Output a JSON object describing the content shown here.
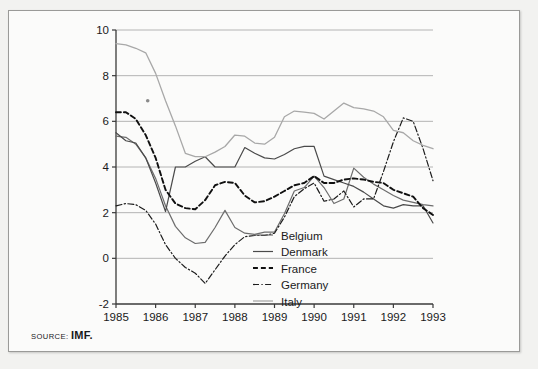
{
  "figure": {
    "source_keyword": "SOURCE:",
    "source_value": "IMF."
  },
  "chart_data": {
    "type": "line",
    "title": "",
    "subtitle": "",
    "xlabel": "",
    "ylabel": "",
    "xlim": [
      1985,
      1993
    ],
    "ylim": [
      -2,
      10
    ],
    "xticks": [
      1985,
      1986,
      1987,
      1988,
      1989,
      1990,
      1991,
      1992,
      1993
    ],
    "xtick_labels": [
      "1985",
      "1986",
      "1987",
      "1988",
      "1989",
      "1990",
      "1991",
      "1992",
      "1993"
    ],
    "yticks": [
      -2,
      0,
      2,
      4,
      6,
      8,
      10
    ],
    "ytick_labels": [
      "-2",
      "0",
      "2",
      "4",
      "6",
      "8",
      "10"
    ],
    "grid": "horizontal",
    "legend_position": "center-right-inside",
    "series": [
      {
        "name": "Belgium",
        "style": "solid",
        "color": "#6d6d6d",
        "width": 1.2,
        "x": [
          1985.0,
          1985.25,
          1985.5,
          1985.75,
          1986.0,
          1986.25,
          1986.5,
          1986.75,
          1987.0,
          1987.25,
          1987.5,
          1987.75,
          1988.0,
          1988.25,
          1988.5,
          1988.75,
          1989.0,
          1989.25,
          1989.5,
          1989.75,
          1990.0,
          1990.25,
          1990.5,
          1990.75,
          1991.0,
          1991.25,
          1991.5,
          1991.75,
          1992.0,
          1992.25,
          1992.5,
          1992.75,
          1993.0
        ],
        "y": [
          5.35,
          5.3,
          5.0,
          4.4,
          3.5,
          2.3,
          1.4,
          0.9,
          0.65,
          0.7,
          1.35,
          2.1,
          1.35,
          1.1,
          1.05,
          1.15,
          1.15,
          1.95,
          2.95,
          3.1,
          3.6,
          3.1,
          2.4,
          2.6,
          3.95,
          3.55,
          3.25,
          3.0,
          2.75,
          2.55,
          2.45,
          2.35,
          2.3
        ]
      },
      {
        "name": "Denmark",
        "style": "solid",
        "color": "#4a4a4a",
        "width": 1.2,
        "x": [
          1985.0,
          1985.25,
          1985.5,
          1985.75,
          1986.0,
          1986.25,
          1986.5,
          1986.75,
          1987.0,
          1987.25,
          1987.5,
          1987.75,
          1988.0,
          1988.25,
          1988.5,
          1988.75,
          1989.0,
          1989.25,
          1989.5,
          1989.75,
          1990.0,
          1990.25,
          1990.5,
          1990.75,
          1991.0,
          1991.25,
          1991.5,
          1991.75,
          1992.0,
          1992.25,
          1992.5,
          1992.75,
          1993.0
        ],
        "y": [
          5.5,
          5.15,
          5.05,
          4.4,
          3.3,
          2.05,
          4.0,
          4.0,
          4.25,
          4.45,
          4.0,
          4.0,
          4.0,
          4.85,
          4.6,
          4.4,
          4.35,
          4.55,
          4.8,
          4.9,
          4.9,
          3.6,
          3.45,
          3.3,
          3.15,
          2.9,
          2.6,
          2.3,
          2.2,
          2.35,
          2.3,
          2.3,
          1.55
        ]
      },
      {
        "name": "France",
        "style": "dashed",
        "color": "#101010",
        "width": 1.9,
        "x": [
          1985.0,
          1985.25,
          1985.5,
          1985.75,
          1986.0,
          1986.25,
          1986.5,
          1986.75,
          1987.0,
          1987.25,
          1987.5,
          1987.75,
          1988.0,
          1988.25,
          1988.5,
          1988.75,
          1989.0,
          1989.25,
          1989.5,
          1989.75,
          1990.0,
          1990.25,
          1990.5,
          1990.75,
          1991.0,
          1991.25,
          1991.5,
          1991.75,
          1992.0,
          1992.25,
          1992.5,
          1992.75,
          1993.0
        ],
        "y": [
          6.4,
          6.4,
          6.1,
          5.4,
          4.4,
          3.0,
          2.4,
          2.2,
          2.15,
          2.55,
          3.2,
          3.35,
          3.3,
          2.75,
          2.45,
          2.5,
          2.7,
          2.95,
          3.2,
          3.3,
          3.6,
          3.3,
          3.3,
          3.45,
          3.5,
          3.45,
          3.35,
          3.3,
          3.0,
          2.85,
          2.7,
          2.2,
          1.9
        ]
      },
      {
        "name": "Germany",
        "style": "dashdot",
        "color": "#1c1c1c",
        "width": 1.2,
        "x": [
          1985.0,
          1985.25,
          1985.5,
          1985.75,
          1986.0,
          1986.25,
          1986.5,
          1986.75,
          1987.0,
          1987.25,
          1987.5,
          1987.75,
          1988.0,
          1988.25,
          1988.5,
          1988.75,
          1989.0,
          1989.25,
          1989.5,
          1989.75,
          1990.0,
          1990.25,
          1990.5,
          1990.75,
          1991.0,
          1991.25,
          1991.5,
          1991.75,
          1992.0,
          1992.25,
          1992.5,
          1992.75,
          1993.0
        ],
        "y": [
          2.3,
          2.4,
          2.35,
          2.1,
          1.5,
          0.6,
          0.0,
          -0.4,
          -0.65,
          -1.1,
          -0.5,
          0.1,
          0.6,
          0.95,
          1.0,
          1.0,
          1.1,
          1.8,
          2.7,
          3.05,
          3.3,
          2.5,
          2.6,
          2.95,
          2.25,
          2.6,
          2.6,
          3.8,
          5.1,
          6.15,
          6.0,
          4.8,
          3.4
        ]
      },
      {
        "name": "Italy",
        "style": "solid",
        "color": "#a8a8a8",
        "width": 1.3,
        "x": [
          1985.0,
          1985.25,
          1985.5,
          1985.75,
          1986.0,
          1986.25,
          1986.5,
          1986.75,
          1987.0,
          1987.25,
          1987.5,
          1987.75,
          1988.0,
          1988.25,
          1988.5,
          1988.75,
          1989.0,
          1989.25,
          1989.5,
          1989.75,
          1990.0,
          1990.25,
          1990.5,
          1990.75,
          1991.0,
          1991.25,
          1991.5,
          1991.75,
          1992.0,
          1992.25,
          1992.5,
          1992.75,
          1993.0
        ],
        "y": [
          9.4,
          9.35,
          9.2,
          9.0,
          8.1,
          6.9,
          5.8,
          4.6,
          4.45,
          4.45,
          4.65,
          4.9,
          5.4,
          5.35,
          5.05,
          5.0,
          5.3,
          6.2,
          6.45,
          6.4,
          6.35,
          6.1,
          6.45,
          6.8,
          6.6,
          6.55,
          6.45,
          6.2,
          5.6,
          5.5,
          5.15,
          4.95,
          4.8
        ]
      }
    ],
    "annotations": [
      {
        "name": "stray-mark",
        "x": 1985.8,
        "y": 6.9
      }
    ]
  },
  "legend": {
    "entries": [
      {
        "label": "Belgium"
      },
      {
        "label": "Denmark"
      },
      {
        "label": "France"
      },
      {
        "label": "Germany"
      },
      {
        "label": "Italy"
      }
    ]
  }
}
